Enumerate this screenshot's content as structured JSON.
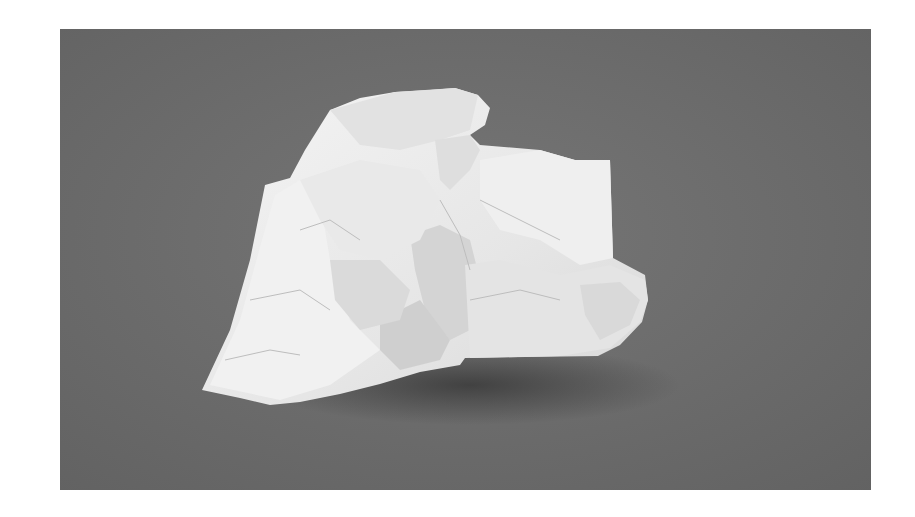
{
  "image": {
    "subject": "crumpled-paper",
    "alt": "Crumpled sheet of white paper on a grey background",
    "colors": {
      "page_background": "#ffffff",
      "backdrop": "#6b6b6b",
      "paper_light": "#f2f2f2",
      "paper_mid": "#dcdcdc",
      "paper_shadow": "#c4c4c4",
      "cast_shadow": "#3e3e3e"
    }
  }
}
